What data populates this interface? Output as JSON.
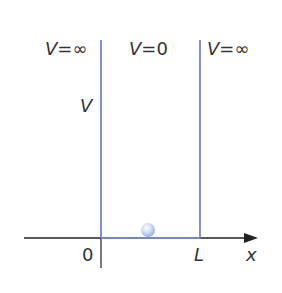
{
  "diagram": {
    "regions": [
      {
        "label_var": "V",
        "label_eq": "=",
        "label_val": "∞"
      },
      {
        "label_var": "V",
        "label_eq": "=",
        "label_val": "0"
      },
      {
        "label_var": "V",
        "label_eq": "=",
        "label_val": "∞"
      }
    ],
    "y_axis_label": "V",
    "x_axis_label": "x",
    "origin_label": "0",
    "well_width_label": "L",
    "colors": {
      "wall": "#6f86d6",
      "axis": "#222222",
      "particle": "#c8d4f2",
      "text": "#333333"
    }
  }
}
